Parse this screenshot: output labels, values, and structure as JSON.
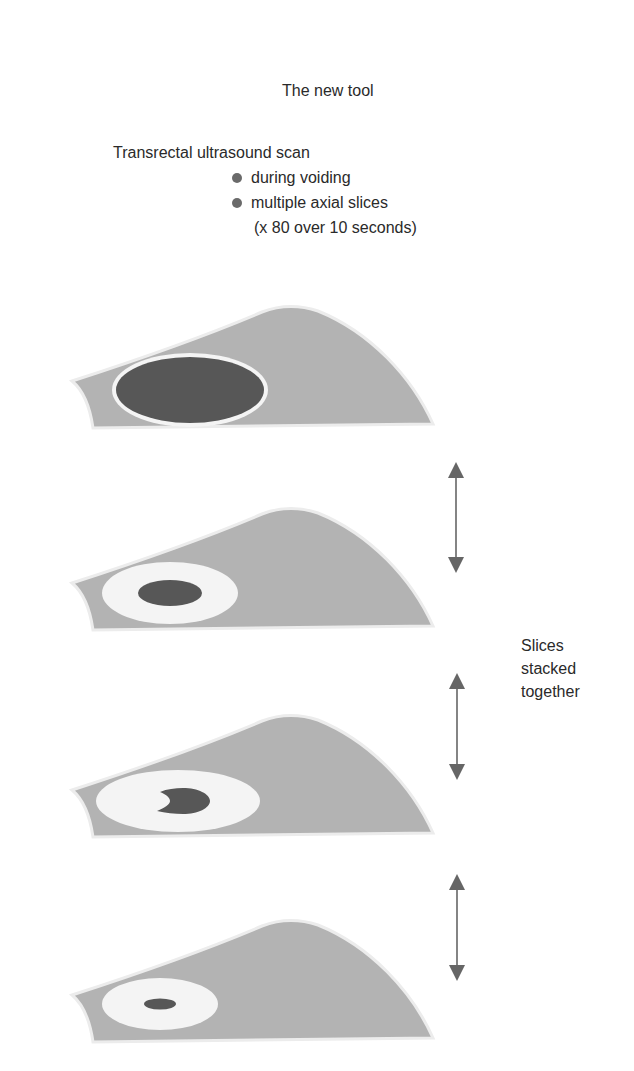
{
  "title": "The new tool",
  "scan": {
    "heading": "Transrectal ultrasound scan",
    "bullets": [
      {
        "label": "during voiding"
      },
      {
        "label": "multiple axial slices",
        "continuation": "(x 80 over 10 seconds)"
      }
    ]
  },
  "side_label": {
    "lines": [
      "Slices",
      "stacked",
      "together"
    ]
  },
  "slices": [
    {
      "name": "slice-1",
      "inner": "large dark ellipse with thin white rim"
    },
    {
      "name": "slice-2",
      "inner": "white ring with dark ellipse"
    },
    {
      "name": "slice-3",
      "inner": "white ring with dark crescent"
    },
    {
      "name": "slice-4",
      "inner": "white ring with small dark ellipse"
    }
  ],
  "arrows": [
    {
      "name": "double-arrow-1"
    },
    {
      "name": "double-arrow-2"
    },
    {
      "name": "double-arrow-3"
    }
  ],
  "colors": {
    "tissue": "#b3b3b3",
    "lumen_dark": "#575757",
    "ring_light": "#f4f4f4",
    "arrow": "#666666",
    "text": "#2a2a2a"
  }
}
